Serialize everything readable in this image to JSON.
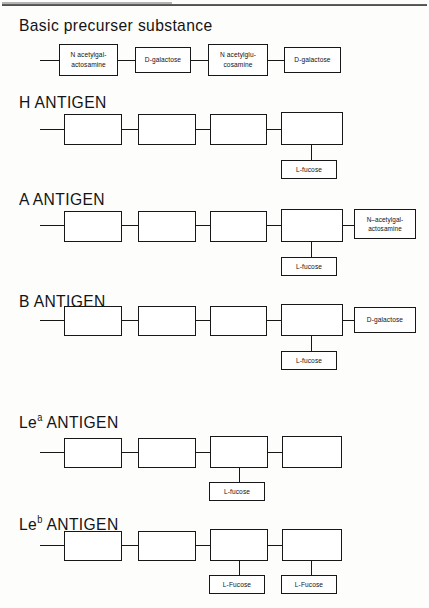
{
  "page": {
    "background_color": "#fdfdfc",
    "line_color": "#171717"
  },
  "sections": [
    {
      "id": "basic-precursor",
      "heading": "Basic precurser substance",
      "chain": [
        {
          "label": "N  acetylgal-\nactosamine"
        },
        {
          "label": "D-galactose"
        },
        {
          "label": "N  acetylglu-\ncosamine"
        },
        {
          "label": "D-galactose"
        }
      ],
      "branches": []
    },
    {
      "id": "h-antigen",
      "heading": "H ANTIGEN",
      "chain": [
        {
          "label": ""
        },
        {
          "label": ""
        },
        {
          "label": ""
        },
        {
          "label": ""
        }
      ],
      "branches": [
        {
          "attach": 4,
          "direction": "down",
          "label": "L-fucose"
        }
      ]
    },
    {
      "id": "a-antigen",
      "heading": "A ANTIGEN",
      "chain": [
        {
          "label": ""
        },
        {
          "label": ""
        },
        {
          "label": ""
        },
        {
          "label": ""
        }
      ],
      "branches": [
        {
          "attach": 4,
          "direction": "down",
          "label": "L-fucose"
        },
        {
          "attach": 4,
          "direction": "right",
          "label": "N–acetylgal-\nactosamine"
        }
      ]
    },
    {
      "id": "b-antigen",
      "heading": "B ANTIGEN",
      "chain": [
        {
          "label": ""
        },
        {
          "label": ""
        },
        {
          "label": ""
        },
        {
          "label": ""
        }
      ],
      "branches": [
        {
          "attach": 4,
          "direction": "down",
          "label": "L-fucose"
        },
        {
          "attach": 4,
          "direction": "right",
          "label": "D-galactose"
        }
      ]
    },
    {
      "id": "lea-antigen",
      "heading_prefix": "Le",
      "heading_sup": "a",
      "heading_suffix": " ANTIGEN",
      "heading": "Lea ANTIGEN",
      "chain": [
        {
          "label": ""
        },
        {
          "label": ""
        },
        {
          "label": ""
        },
        {
          "label": ""
        }
      ],
      "branches": [
        {
          "attach": 3,
          "direction": "down",
          "label": "L-fucose"
        }
      ]
    },
    {
      "id": "leb-antigen",
      "heading_prefix": "Le",
      "heading_sup": "b",
      "heading_suffix": " ANTIGEN",
      "heading": "Leb ANTIGEN",
      "chain": [
        {
          "label": ""
        },
        {
          "label": ""
        },
        {
          "label": ""
        },
        {
          "label": ""
        }
      ],
      "branches": [
        {
          "attach": 3,
          "direction": "down",
          "label": "L-Fucose"
        },
        {
          "attach": 4,
          "direction": "down",
          "label": "L-Fucose"
        }
      ]
    }
  ]
}
